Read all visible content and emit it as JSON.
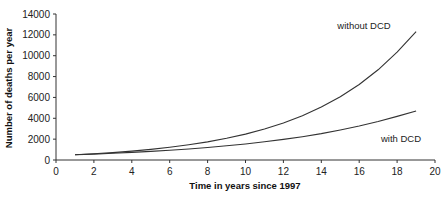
{
  "chart_data": {
    "type": "line",
    "title": "",
    "xlabel": "Time in years since 1997",
    "ylabel": "Number of deaths per year",
    "xlim": [
      0,
      20
    ],
    "ylim": [
      0,
      14000
    ],
    "x_ticks": [
      0,
      2,
      4,
      6,
      8,
      10,
      12,
      14,
      16,
      18,
      20
    ],
    "y_ticks": [
      0,
      2000,
      4000,
      6000,
      8000,
      10000,
      12000,
      14000
    ],
    "grid": false,
    "legend": "inline labels",
    "x": [
      1,
      2,
      3,
      4,
      5,
      6,
      7,
      8,
      9,
      10,
      11,
      12,
      13,
      14,
      15,
      16,
      17,
      18,
      19
    ],
    "series": [
      {
        "name": "without DCD",
        "values": [
          500,
          598,
          714,
          853,
          1020,
          1219,
          1456,
          1740,
          2080,
          2485,
          2970,
          3549,
          4241,
          5068,
          6056,
          7237,
          8648,
          10335,
          12300
        ]
      },
      {
        "name": "with DCD",
        "values": [
          500,
          567,
          642,
          727,
          824,
          934,
          1058,
          1199,
          1358,
          1539,
          1744,
          1976,
          2239,
          2536,
          2874,
          3256,
          3689,
          4180,
          4700
        ]
      }
    ],
    "annotations": [
      {
        "text": "without DCD",
        "near_series": "without DCD"
      },
      {
        "text": "with DCD",
        "near_series": "with DCD"
      }
    ]
  }
}
